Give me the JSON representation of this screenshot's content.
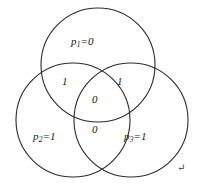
{
  "figure": {
    "type": "three-circle-venn-diagram",
    "background_color": "#ffffff",
    "stroke_color": "#2b2b2b",
    "text_color": "#1a1a1a"
  },
  "sets": [
    {
      "id": "p1",
      "name": "top-circle",
      "label_prefix": "p",
      "label_subscript": "1",
      "label_suffix": "=0",
      "value": "0",
      "cx": 98,
      "cy": 65,
      "r": 57
    },
    {
      "id": "p2",
      "name": "bottom-left-circle",
      "label_prefix": "p",
      "label_subscript": "2",
      "label_suffix": "=1",
      "value": "1",
      "cx": 73,
      "cy": 120,
      "r": 57
    },
    {
      "id": "p3",
      "name": "bottom-right-circle",
      "label_prefix": "p",
      "label_subscript": "3",
      "label_suffix": "=1",
      "value": "1",
      "cx": 131,
      "cy": 120,
      "r": 57
    }
  ],
  "regions": [
    {
      "id": "p1-p2",
      "name": "upper-left-intersection",
      "value": "1"
    },
    {
      "id": "p1-p3",
      "name": "upper-right-intersection",
      "value": "1"
    },
    {
      "id": "p1-p2-p3",
      "name": "center-triple-intersection",
      "value": "0"
    },
    {
      "id": "p2-p3",
      "name": "lower-middle-intersection",
      "value": "0"
    }
  ],
  "marks": {
    "paragraph_return": "↵"
  }
}
